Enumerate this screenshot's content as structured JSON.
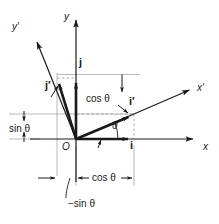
{
  "figure": {
    "type": "vector-diagram",
    "background_color": "#ffffff",
    "ink_color": "#1a1a1a",
    "guide_color": "#9a9a9a",
    "origin_px": [
      76,
      139
    ],
    "rotation_angle_label": "θ"
  },
  "axes": [
    {
      "name": "x-axis",
      "label": "x",
      "kind": "original",
      "from_px": [
        30,
        139
      ],
      "to_px": [
        200,
        139
      ],
      "arrow": "end"
    },
    {
      "name": "y-axis",
      "label": "y",
      "kind": "original",
      "from_px": [
        76,
        185
      ],
      "to_px": [
        76,
        14
      ],
      "arrow": "end"
    },
    {
      "name": "x-prime-axis",
      "label": "x′",
      "kind": "rotated",
      "from_px": [
        76,
        139
      ],
      "to_px": [
        196,
        87
      ],
      "arrow": "end"
    },
    {
      "name": "y-prime-axis",
      "label": "y′",
      "kind": "rotated",
      "from_px": [
        76,
        139
      ],
      "to_px": [
        31,
        27
      ],
      "arrow": "end"
    }
  ],
  "axis_labels": {
    "x": {
      "text": "x",
      "pos_px": [
        204,
        142
      ]
    },
    "y": {
      "text": "y",
      "pos_px": [
        64,
        12
      ]
    },
    "x_prime": {
      "text": "x′",
      "pos_px": [
        198,
        86
      ]
    },
    "y_prime": {
      "text": "y′",
      "pos_px": [
        13,
        24
      ]
    }
  },
  "vectors": [
    {
      "name": "i",
      "label": "i",
      "description": "unit vector along x",
      "tip_px": [
        134,
        139
      ],
      "label_pos_px": [
        131,
        142
      ]
    },
    {
      "name": "j",
      "label": "j",
      "description": "unit vector along y",
      "tip_px": [
        76,
        77
      ],
      "label_pos_px": [
        79,
        58
      ]
    },
    {
      "name": "i-prime",
      "label": "i′",
      "description": "unit vector along x′",
      "tip_px": [
        134,
        114
      ],
      "label_pos_px": [
        130,
        98
      ]
    },
    {
      "name": "j-prime",
      "label": "j′",
      "description": "unit vector along y′",
      "tip_px": [
        57,
        79
      ],
      "label_pos_px": [
        46,
        82
      ]
    }
  ],
  "components": {
    "i_prime": {
      "x": "cos θ",
      "y": "sin θ"
    },
    "j_prime": {
      "x": "−sin θ",
      "y": "cos θ"
    }
  },
  "annotations": [
    {
      "name": "angle-theta-x",
      "text": "θ",
      "pos_px": [
        113,
        124
      ],
      "role": "angle between x and x′"
    },
    {
      "name": "cos-theta-upper",
      "text": "cos θ",
      "pos_px": [
        87,
        94
      ],
      "role": "vertical component of j′"
    },
    {
      "name": "sin-theta-left",
      "text": "sin θ",
      "pos_px": [
        9,
        124
      ],
      "role": "vertical component of i′"
    },
    {
      "name": "cos-theta-lower",
      "text": "cos θ",
      "pos_px": [
        91,
        172
      ],
      "role": "horizontal component of i′"
    },
    {
      "name": "neg-sin-theta",
      "text": "−sin θ",
      "pos_px": [
        69,
        199
      ],
      "role": "horizontal component of j′"
    },
    {
      "name": "origin",
      "text": "O",
      "pos_px": [
        63,
        143
      ],
      "role": "origin"
    }
  ]
}
